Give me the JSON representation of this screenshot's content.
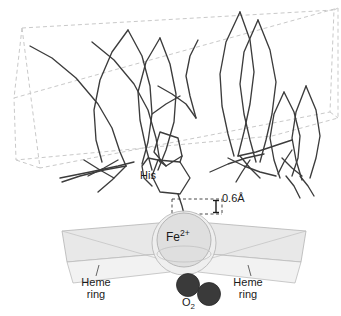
{
  "figure": {
    "labels": {
      "his": "His",
      "distance": "0.6Å",
      "fe_base": "Fe",
      "fe_charge": "2+",
      "heme_left_line1": "Heme",
      "heme_left_line2": "ring",
      "heme_right_line1": "Heme",
      "heme_right_line2": "ring",
      "o2_base": "O",
      "o2_sub": "2"
    },
    "colors": {
      "background": "#ffffff",
      "backbone_stroke": "#3c3c3c",
      "dashed_box_stroke": "#c9c9c9",
      "heme_plane_fill": "#e8e8e8",
      "heme_plane_stroke": "#b4b4b4",
      "fe_sphere_outer_fill": "#ebebeb",
      "fe_sphere_inner_fill": "#dedede",
      "fe_sphere_stroke": "#b0b0b0",
      "o2_fill": "#3a3a3a",
      "o2_stroke": "#2a2a2a",
      "label_text": "#1a1a1a",
      "leader_line": "#555555",
      "dimension_line": "#333333"
    },
    "geometry": {
      "fe_center_x": 184,
      "fe_center_y": 243,
      "fe_outer_radius": 32,
      "fe_inner_radius": 27,
      "o2_atom1": {
        "cx": 188,
        "cy": 286,
        "r": 11
      },
      "o2_atom2": {
        "cx": 210,
        "cy": 294,
        "r": 11
      },
      "displacement_value": "0.6Å"
    },
    "backbone_polylines": [
      "30,46 60,55 86,80 104,99 116,117 124,140 131,160",
      "90,42 118,61 140,85 152,108 160,133 166,158",
      "30,46 66,68 92,94 112,120 128,148 140,168",
      "127,28 144,54 152,84 150,112 144,140 138,160",
      "127,28 106,58 96,86 92,116 96,146 104,166",
      "160,38 172,62 176,92 172,120 164,148 158,168",
      "160,38 142,66 136,96 140,124 148,150 154,170",
      "206,78 216,100 220,126 216,150 208,170",
      "206,78 192,100 186,124 188,148 194,168",
      "244,14 252,44 254,76 250,108 244,136 238,158",
      "244,14 228,44 222,76 224,108 230,136 236,158",
      "262,22 272,52 276,84 272,116 266,142 260,162",
      "262,22 248,54 244,86 248,116 254,142 258,162",
      "286,94 296,114 302,138 300,160 294,176",
      "286,94 276,116 272,140 276,162 282,178",
      "308,86 318,110 322,136 318,160 312,178",
      "308,86 298,112 294,138 298,162 304,180"
    ],
    "backbone_segments": [
      "30,46 55,58",
      "55,58 78,80",
      "78,80 98,104",
      "98,104 112,128",
      "112,128 120,152",
      "120,152 126,172",
      "90,42 112,60",
      "112,60 132,84",
      "132,84 146,110",
      "146,110 154,138",
      "154,138 158,164",
      "127,28 140,56",
      "140,56 150,86",
      "150,86 152,116",
      "152,116 148,144",
      "148,144 142,166",
      "127,28 110,52",
      "110,52 98,80",
      "98,80 92,110",
      "92,110 94,140",
      "94,140 100,164",
      "160,38 170,64",
      "170,64 176,94",
      "176,94 174,124",
      "174,124 166,152",
      "166,152 158,172",
      "160,38 144,62",
      "144,62 136,92",
      "136,92 138,122",
      "138,122 146,150",
      "146,150 152,172"
    ],
    "heme_plane_left": "63,232 162,224 162,255 68,263",
    "heme_plane_right": "206,224 305,232 300,263 206,255",
    "dashed_box_front": "22,92 318,14 330,126 34,180",
    "dashed_box_back": "10,58 306,22 318,92 22,134"
  }
}
